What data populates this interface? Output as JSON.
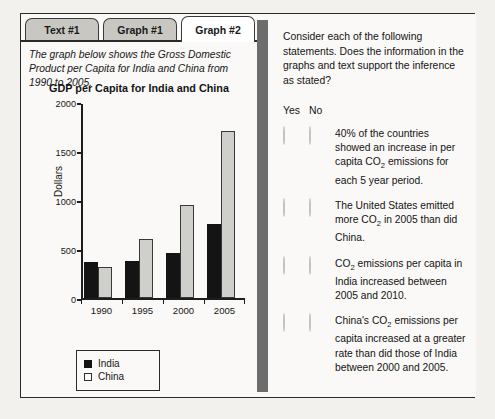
{
  "tabs": [
    {
      "label": "Text #1",
      "active": false
    },
    {
      "label": "Graph #1",
      "active": false
    },
    {
      "label": "Graph #2",
      "active": true
    }
  ],
  "left_panel": {
    "stem_text": "The graph below shows the Gross Domestic Product per Capita for India and China from 1990 to 2005."
  },
  "chart_data": {
    "type": "bar",
    "title": "GDP per Capita for India and China",
    "xlabel": "",
    "ylabel": "Dollars",
    "categories": [
      "1990",
      "1995",
      "2000",
      "2005"
    ],
    "series": [
      {
        "name": "India",
        "color": "#141414",
        "values": [
          380,
          385,
          465,
          770
        ]
      },
      {
        "name": "China",
        "color": "#cfcfcb",
        "values": [
          320,
          610,
          960,
          1730
        ]
      }
    ],
    "ylim": [
      0,
      2000
    ],
    "yticks": [
      0,
      500,
      1000,
      1500,
      2000
    ],
    "ytick_labels": [
      "0",
      "500",
      "1000",
      "1500",
      "2000"
    ],
    "grid": false,
    "legend_position": "below-axes-left"
  },
  "right_panel": {
    "prompt": "Consider each of the following statements. Does the information in the graphs and text support the inference as stated?",
    "column_headers": {
      "yes": "Yes",
      "no": "No"
    },
    "statements": [
      {
        "id": 1,
        "text_parts": [
          "40% of the countries showed an increase in per capita CO",
          "2",
          " emissions for each 5 year period."
        ]
      },
      {
        "id": 2,
        "text_parts": [
          "The United States emitted more CO",
          "2",
          " in 2005 than did China."
        ]
      },
      {
        "id": 3,
        "text_parts": [
          "CO",
          "2",
          " emissions per capita in India increased between 2005 and 2010."
        ]
      },
      {
        "id": 4,
        "text_parts": [
          "China's CO",
          "2",
          " emissions per capita increased at a greater rate than did those of India between 2000 and 2005."
        ]
      }
    ]
  },
  "colors": {
    "page_background": "#f2f1ee",
    "frame_border": "#2b2b2b",
    "panel_background": "#faf9f7",
    "tab_inactive": "#c9c7c2",
    "tab_active": "#ffffff",
    "divider": "#6d6d6d",
    "india_bar": "#141414",
    "china_bar": "#cfcfcb",
    "radio": "#dcdcda"
  }
}
